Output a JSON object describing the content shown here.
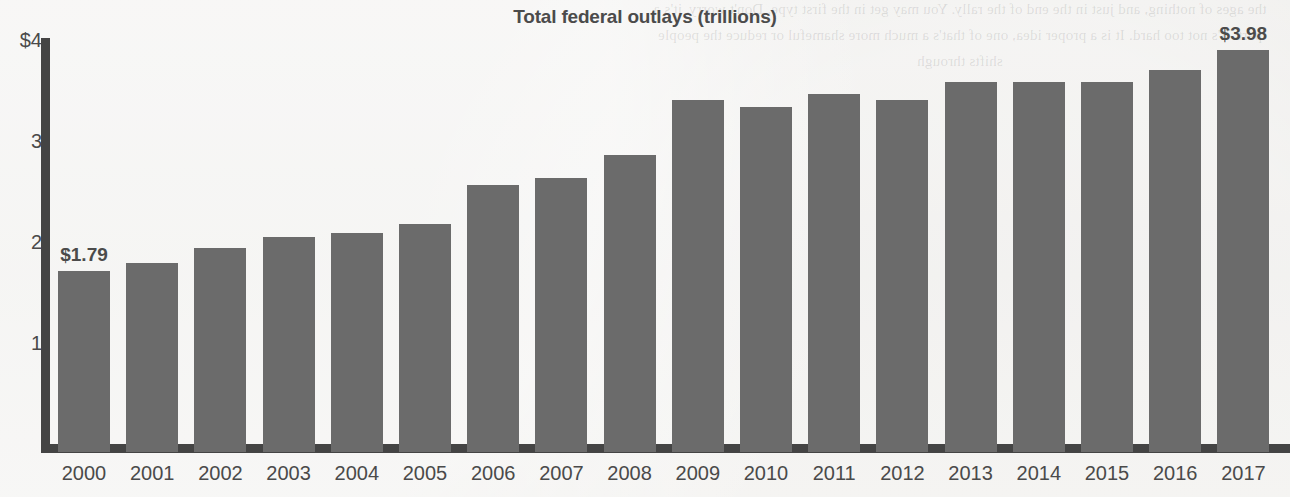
{
  "chart_data": {
    "type": "bar",
    "title": "Total federal outlays (trillions)",
    "xlabel": "",
    "ylabel": "",
    "ylim": [
      0,
      4
    ],
    "grid": false,
    "legend": null,
    "y_tick_labels": [
      "$4",
      "3",
      "2",
      "1"
    ],
    "y_tick_values": [
      4,
      3,
      2,
      1
    ],
    "categories": [
      "2000",
      "2001",
      "2002",
      "2003",
      "2004",
      "2005",
      "2006",
      "2007",
      "2008",
      "2009",
      "2010",
      "2011",
      "2012",
      "2013",
      "2014",
      "2015",
      "2016",
      "2017"
    ],
    "values": [
      1.79,
      1.87,
      2.02,
      2.13,
      2.17,
      2.26,
      2.64,
      2.71,
      2.94,
      3.49,
      3.42,
      3.54,
      3.49,
      3.66,
      3.66,
      3.66,
      3.78,
      3.98
    ],
    "data_labels": {
      "2000": "$1.79",
      "2017": "$3.98"
    },
    "annotations": [
      {
        "category": "2000",
        "text": "$1.79"
      },
      {
        "category": "2017",
        "text": "$3.98"
      }
    ],
    "colors": {
      "bar": "#6b6b6b",
      "axis": "#444444",
      "title_text": "#4b4b4b",
      "tick_text": "#4a4a4a",
      "label_text": "#4b4b4b",
      "background": "#ececea"
    }
  },
  "background_ghost_text": "the ages of nothing, and just in the end of the rally. You may get in the first type. Don't worry, it's a part. It's not too hard. It is a proper idea, one of that's a much more shameful or reduce the people shifts through"
}
